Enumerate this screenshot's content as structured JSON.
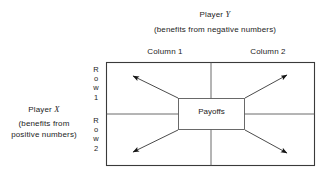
{
  "figure": {
    "title_top": {
      "player": "Player Y",
      "player_name": "Y",
      "player_prefix": "Player ",
      "note": "(benefits from negative numbers)"
    },
    "title_left": {
      "player_prefix": "Player ",
      "player_name": "X",
      "note_line1": "(benefits from",
      "note_line2": "positive numbers)"
    },
    "columns": [
      {
        "label": "Column 1"
      },
      {
        "label": "Column 2"
      }
    ],
    "rows": [
      {
        "stack": [
          "R",
          "o",
          "w",
          "1"
        ]
      },
      {
        "stack": [
          "R",
          "o",
          "w",
          "2"
        ]
      }
    ],
    "center_box": {
      "label": "Payoffs"
    },
    "arrows": [
      {
        "name": "arrow-top-left",
        "from": [
          178,
          98
        ],
        "to": [
          130,
          75
        ]
      },
      {
        "name": "arrow-top-right",
        "from": [
          245,
          98
        ],
        "to": [
          290,
          74
        ]
      },
      {
        "name": "arrow-bottom-left",
        "from": [
          178,
          130
        ],
        "to": [
          130,
          153
        ]
      },
      {
        "name": "arrow-bottom-right",
        "from": [
          245,
          130
        ],
        "to": [
          290,
          154
        ]
      }
    ],
    "colors": {
      "background": "#ffffff",
      "ink": "#1c1c1c",
      "line": "#4a4a4a",
      "outer_border": "#3a3a3a"
    },
    "geometry": {
      "outer": {
        "x": 106,
        "y": 62,
        "w": 209,
        "h": 104
      },
      "v_divider_x": 211,
      "h_divider_y": 114,
      "center_box": {
        "x": 178,
        "y": 98,
        "w": 67,
        "h": 32
      }
    }
  }
}
